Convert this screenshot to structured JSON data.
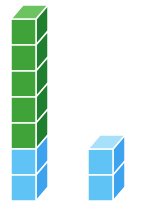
{
  "diagram": {
    "stacks": [
      {
        "name": "left-stack",
        "x": 11,
        "cubes": [
          "green",
          "green",
          "green",
          "green",
          "green",
          "blue",
          "blue"
        ],
        "count_green": 5,
        "count_blue": 2,
        "total": 7
      },
      {
        "name": "right-stack",
        "x": 88,
        "cubes": [
          "blue",
          "blue"
        ],
        "count_green": 0,
        "count_blue": 2,
        "total": 2
      }
    ],
    "colors": {
      "green": {
        "front": "#3fa33a",
        "side": "#1f7f2e",
        "top": "#6cc461"
      },
      "blue": {
        "front": "#5fc3f5",
        "side": "#3ea3ef",
        "top": "#a6e0fa"
      },
      "edge": "#ffffff",
      "background": "#ffffff"
    },
    "geometry": {
      "cube_width": 25,
      "cube_height": 26,
      "depth_x": 12,
      "depth_y": 14,
      "base_y": 201
    }
  }
}
